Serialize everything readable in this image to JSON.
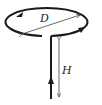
{
  "diagram": {
    "type": "current-loop-with-lead-wire",
    "labels": {
      "diameter": "D",
      "height": "H"
    },
    "colors": {
      "wire": "#1a1a1a",
      "dimension": "#444444",
      "background": "#ffffff"
    },
    "elements": [
      {
        "name": "circular-loop",
        "description": "circular wire loop seen in perspective with current direction arrows"
      },
      {
        "name": "vertical-wire",
        "description": "straight lead wire with upward current arrow"
      },
      {
        "name": "diameter-dimension",
        "label": "D"
      },
      {
        "name": "height-dimension",
        "label": "H"
      }
    ]
  }
}
